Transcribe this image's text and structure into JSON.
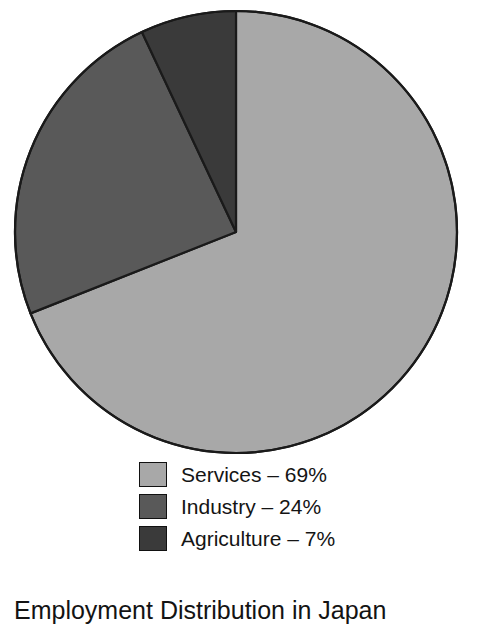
{
  "chart_data": {
    "type": "pie",
    "title": "Employment Distribution in Japan",
    "categories": [
      "Services",
      "Industry",
      "Agriculture"
    ],
    "values": [
      69,
      24,
      7
    ],
    "value_unit": "%",
    "labels": [
      "Services – 69%",
      "Industry – 24%",
      "Agriculture – 7%"
    ],
    "colors": [
      "#a8a8a8",
      "#595959",
      "#3a3a3a"
    ],
    "legend_position": "bottom",
    "start_angle_deg": 0,
    "direction": "clockwise",
    "grid": false,
    "xlabel": "",
    "ylabel": ""
  },
  "pie": {
    "center_x": 236,
    "center_y": 232,
    "radius": 221,
    "outline_color": "#1a1a1a",
    "slices": [
      {
        "name": "Services",
        "percent": 69,
        "color": "#a8a8a8"
      },
      {
        "name": "Industry",
        "percent": 24,
        "color": "#595959"
      },
      {
        "name": "Agriculture",
        "percent": 7,
        "color": "#3a3a3a"
      }
    ]
  },
  "legend": {
    "items": [
      {
        "label": "Services – 69%",
        "color": "#a8a8a8"
      },
      {
        "label": "Industry – 24%",
        "color": "#595959"
      },
      {
        "label": "Agriculture – 7%",
        "color": "#3a3a3a"
      }
    ]
  },
  "caption": {
    "text": "Employment Distribution in Japan"
  }
}
